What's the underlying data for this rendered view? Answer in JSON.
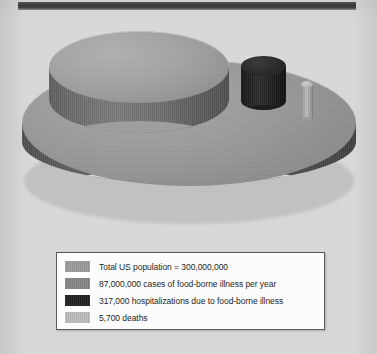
{
  "page": {
    "background_color": "#d9d9d9",
    "top_rule_color": "#2e2e2e"
  },
  "chart_data": {
    "type": "bar",
    "title": "",
    "subtitle": "",
    "xlabel": "",
    "ylabel": "",
    "grid": false,
    "legend_position": "bottom",
    "note": "Proportional 3D cylinder (volume) comparison of US food-borne illness statistics",
    "categories": [
      "Total US population",
      "Cases of food-borne illness per year",
      "Hospitalizations due to food-borne illness",
      "Deaths"
    ],
    "values": [
      300000000,
      87000000,
      317000,
      5700
    ],
    "value_labels": [
      "300,000,000",
      "87,000,000",
      "317,000",
      "5,700"
    ],
    "colors": [
      "#9b9b9b",
      "#8f8f8f",
      "#1e1e1e",
      "#b3b3b3"
    ]
  },
  "legend": {
    "items": [
      {
        "color": "#9b9b9b",
        "label": "Total US population = 300,000,000",
        "swatch_name": "legend-swatch-total-us-population"
      },
      {
        "color": "#858585",
        "label": "87,000,000 cases of food-borne illness per year",
        "swatch_name": "legend-swatch-cases"
      },
      {
        "color": "#1e1e1e",
        "label": "317,000 hospitalizations due to food-borne illness",
        "swatch_name": "legend-swatch-hospitalizations"
      },
      {
        "color": "#bdbdbd",
        "label": "5,700 deaths",
        "swatch_name": "legend-swatch-deaths"
      }
    ]
  },
  "figure_elements": {
    "cylinder_population": "Total US population cylinder",
    "cylinder_cases": "Food-borne illness cases cylinder",
    "cylinder_hospitalizations": "Hospitalizations cylinder",
    "cylinder_deaths": "Deaths cylinder"
  }
}
